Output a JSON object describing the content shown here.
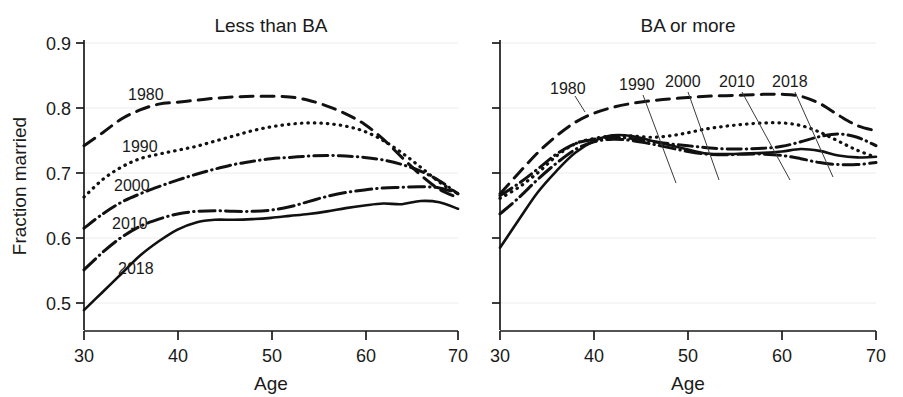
{
  "figure": {
    "background": "#ffffff",
    "ink_color": "#111111",
    "grid_color": "#ececec"
  },
  "axis": {
    "ylabel": "Fraction married",
    "xlabel_left": "Age",
    "xlabel_right": "Age",
    "yticks": [
      "0.9",
      "0.8",
      "0.7",
      "0.6",
      "0.5"
    ],
    "xticks": [
      "30",
      "40",
      "50",
      "60",
      "70"
    ]
  },
  "panels": [
    {
      "id": "less-than-ba",
      "title": "Less than BA"
    },
    {
      "id": "ba-or-more",
      "title": "BA or more"
    }
  ],
  "series_labels": {
    "y1980": "1980",
    "y1990": "1990",
    "y2000": "2000",
    "y2010": "2010",
    "y2018": "2018"
  },
  "chart_data": {
    "type": "line",
    "xlabel": "Age",
    "ylabel": "Fraction married",
    "xlim": [
      30,
      70
    ],
    "ylim": [
      0.46,
      0.905
    ],
    "grid": true,
    "legend": "inline-annotations",
    "x": [
      30,
      32,
      34,
      36,
      38,
      40,
      42,
      44,
      46,
      48,
      50,
      52,
      54,
      56,
      58,
      60,
      62,
      64,
      66,
      68,
      70
    ],
    "panels": [
      {
        "name": "Less than BA",
        "series": [
          {
            "name": "1980",
            "style": "dashed",
            "values": [
              0.742,
              0.762,
              0.783,
              0.797,
              0.806,
              0.809,
              0.812,
              0.815,
              0.817,
              0.818,
              0.818,
              0.817,
              0.812,
              0.803,
              0.791,
              0.775,
              0.752,
              0.724,
              0.697,
              0.675,
              0.662
            ]
          },
          {
            "name": "1990",
            "style": "dotted",
            "values": [
              0.663,
              0.69,
              0.709,
              0.722,
              0.729,
              0.735,
              0.741,
              0.749,
              0.757,
              0.765,
              0.771,
              0.775,
              0.777,
              0.776,
              0.772,
              0.764,
              0.75,
              0.731,
              0.709,
              0.686,
              0.668
            ]
          },
          {
            "name": "2000",
            "style": "dash-dot",
            "values": [
              0.615,
              0.637,
              0.655,
              0.668,
              0.679,
              0.689,
              0.698,
              0.706,
              0.713,
              0.718,
              0.722,
              0.724,
              0.726,
              0.727,
              0.726,
              0.724,
              0.72,
              0.713,
              0.703,
              0.688,
              0.668
            ]
          },
          {
            "name": "2010",
            "style": "dash-dot-dot",
            "values": [
              0.551,
              0.578,
              0.601,
              0.618,
              0.629,
              0.637,
              0.641,
              0.642,
              0.641,
              0.641,
              0.643,
              0.648,
              0.656,
              0.664,
              0.67,
              0.674,
              0.677,
              0.678,
              0.679,
              0.677,
              0.669
            ]
          },
          {
            "name": "2018",
            "style": "solid",
            "values": [
              0.489,
              0.517,
              0.545,
              0.573,
              0.595,
              0.613,
              0.624,
              0.628,
              0.628,
              0.629,
              0.631,
              0.634,
              0.637,
              0.641,
              0.646,
              0.65,
              0.653,
              0.652,
              0.657,
              0.655,
              0.645
            ]
          }
        ]
      },
      {
        "name": "BA or more",
        "series": [
          {
            "name": "1980",
            "style": "dashed",
            "values": [
              0.668,
              0.7,
              0.731,
              0.757,
              0.778,
              0.792,
              0.801,
              0.807,
              0.811,
              0.814,
              0.816,
              0.818,
              0.819,
              0.82,
              0.821,
              0.821,
              0.818,
              0.807,
              0.789,
              0.773,
              0.765
            ]
          },
          {
            "name": "1990",
            "style": "dotted",
            "values": [
              0.661,
              0.678,
              0.7,
              0.726,
              0.745,
              0.753,
              0.757,
              0.757,
              0.755,
              0.757,
              0.762,
              0.768,
              0.772,
              0.775,
              0.777,
              0.777,
              0.773,
              0.763,
              0.749,
              0.735,
              0.724
            ]
          },
          {
            "name": "2000",
            "style": "dash-dot",
            "values": [
              0.665,
              0.684,
              0.706,
              0.729,
              0.745,
              0.752,
              0.755,
              0.753,
              0.749,
              0.745,
              0.742,
              0.739,
              0.737,
              0.737,
              0.738,
              0.741,
              0.748,
              0.756,
              0.76,
              0.755,
              0.742
            ]
          },
          {
            "name": "2010",
            "style": "dash-dot-dot",
            "values": [
              0.637,
              0.662,
              0.69,
              0.715,
              0.736,
              0.748,
              0.752,
              0.75,
              0.745,
              0.739,
              0.733,
              0.729,
              0.728,
              0.729,
              0.729,
              0.727,
              0.722,
              0.716,
              0.713,
              0.713,
              0.716
            ]
          },
          {
            "name": "2018",
            "style": "solid",
            "values": [
              0.585,
              0.628,
              0.67,
              0.703,
              0.731,
              0.749,
              0.758,
              0.757,
              0.75,
              0.743,
              0.736,
              0.73,
              0.729,
              0.73,
              0.731,
              0.733,
              0.737,
              0.734,
              0.727,
              0.724,
              0.725
            ]
          }
        ]
      }
    ]
  }
}
